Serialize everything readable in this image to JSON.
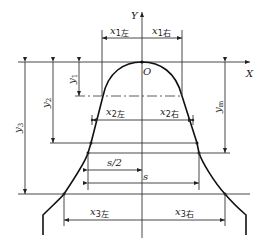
{
  "diagram": {
    "axes": {
      "y_label": "Y",
      "x_label": "X",
      "origin_label": "O"
    },
    "dimensions": {
      "x1_left": {
        "base": "x",
        "sub": "1左"
      },
      "x1_right": {
        "base": "x",
        "sub": "1右"
      },
      "x2_left": {
        "base": "x",
        "sub": "2左"
      },
      "x2_right": {
        "base": "x",
        "sub": "2右"
      },
      "x3_left": {
        "base": "x",
        "sub": "3左"
      },
      "x3_right": {
        "base": "x",
        "sub": "3右"
      },
      "y1": {
        "base": "y",
        "sub": "1"
      },
      "y2": {
        "base": "y",
        "sub": "2"
      },
      "y3": {
        "base": "y",
        "sub": "3"
      },
      "ym": {
        "base": "y",
        "sub": "m"
      },
      "s_half": "s/2",
      "s": "s"
    }
  }
}
